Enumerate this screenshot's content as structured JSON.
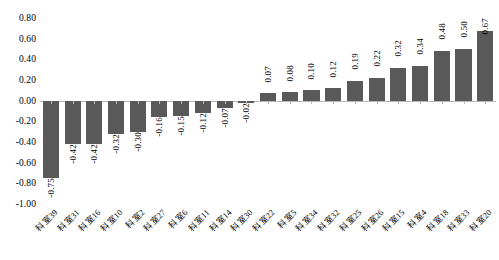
{
  "chart_data": {
    "type": "bar",
    "title": "",
    "subtitle": "",
    "xlabel": "",
    "ylabel": "",
    "ylim": [
      -1.0,
      0.8
    ],
    "grid": false,
    "legend": null,
    "orientation": "vertical",
    "sorted": "ascending",
    "bar_color": "#595959",
    "axis_color": "#b6b6b6",
    "y_ticks": [
      "0.80",
      "0.60",
      "0.40",
      "0.20",
      "0.00",
      "-0.20",
      "-0.40",
      "-0.60",
      "-0.80",
      "-1.00"
    ],
    "y_tick_values": [
      0.8,
      0.6,
      0.4,
      0.2,
      0.0,
      -0.2,
      -0.4,
      -0.6,
      -0.8,
      -1.0
    ],
    "categories": [
      "科室39",
      "科室31",
      "科室16",
      "科室10",
      "科室2",
      "科室27",
      "科室6",
      "科室11",
      "科室14",
      "科室30",
      "科室22",
      "科室5",
      "科室34",
      "科室32",
      "科室25",
      "科室26",
      "科室15",
      "科室4",
      "科室18",
      "科室33",
      "科室20"
    ],
    "values": [
      -0.75,
      -0.42,
      -0.42,
      -0.32,
      -0.3,
      -0.16,
      -0.15,
      -0.12,
      -0.07,
      -0.02,
      0.07,
      0.08,
      0.1,
      0.12,
      0.19,
      0.22,
      0.32,
      0.34,
      0.48,
      0.5,
      0.67
    ],
    "data_labels": [
      "-0.75",
      "-0.42",
      "-0.42",
      "-0.32",
      "-0.30",
      "-0.16",
      "-0.15",
      "-0.12",
      "-0.07",
      "-0.02",
      "0.07",
      "0.08",
      "0.10",
      "0.12",
      "0.19",
      "0.22",
      "0.32",
      "0.34",
      "0.48",
      "0.50",
      "0.67"
    ]
  }
}
